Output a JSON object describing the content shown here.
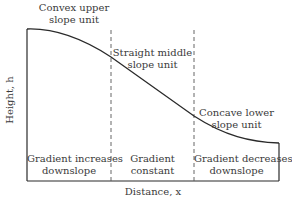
{
  "diagram": {
    "axes": {
      "y_label": "Height, h",
      "x_label": "Distance, x"
    },
    "units": [
      {
        "name": "Convex upper slope unit",
        "line1": "Convex upper",
        "line2": "slope unit",
        "gradient_line1": "Gradient increases",
        "gradient_line2": "downslope"
      },
      {
        "name": "Straight middle slope unit",
        "line1": "Straight middle",
        "line2": "slope unit",
        "gradient_line1": "Gradient",
        "gradient_line2": "constant"
      },
      {
        "name": "Concave lower slope unit",
        "line1": "Concave lower",
        "line2": "slope unit",
        "gradient_line1": "Gradient decreases",
        "gradient_line2": "downslope"
      }
    ],
    "colors": {
      "line": "#2a2a2a",
      "text": "#3a3a3a",
      "divider": "#555555"
    }
  }
}
